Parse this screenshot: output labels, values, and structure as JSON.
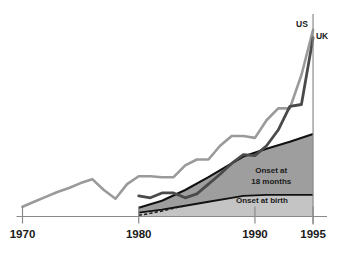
{
  "chart_data": {
    "type": "line",
    "title": "",
    "xlabel": "",
    "ylabel": "",
    "xlim": [
      1970,
      1996.2
    ],
    "ylim": [
      0,
      100
    ],
    "grid": false,
    "legend_position": "inline-endpoint-labels",
    "tick_labels": [
      "1970",
      "1980",
      "1990",
      "1995"
    ],
    "ticks": [
      1970,
      1980,
      1990,
      1995
    ],
    "annotations": [
      {
        "text": "Onset at 18 months",
        "line1": "Onset at",
        "line2": "18 months",
        "x": 1991.4,
        "y": 19
      },
      {
        "text": "Onset at birth",
        "line1": "Onset at birth",
        "x": 1990.6,
        "y": 7
      }
    ],
    "series": [
      {
        "name": "US",
        "label": "US",
        "color": "#9a9a9a",
        "style": "solid",
        "x": [
          1970,
          1971,
          1972,
          1973,
          1974,
          1975,
          1976,
          1977,
          1978,
          1979,
          1980,
          1981,
          1982,
          1983,
          1984,
          1985,
          1986,
          1987,
          1988,
          1989,
          1990,
          1991,
          1992,
          1993,
          1994,
          1995
        ],
        "values": [
          5.0,
          7.5,
          10.0,
          12.5,
          14.5,
          17.0,
          19.0,
          13.5,
          9.0,
          16.5,
          20.5,
          20.5,
          20.0,
          20.0,
          26.0,
          29.0,
          29.0,
          36.0,
          41.0,
          41.0,
          40.0,
          49.0,
          55.0,
          55.0,
          72.0,
          95.0
        ]
      },
      {
        "name": "UK",
        "label": "UK",
        "color": "#4a4a4a",
        "style": "solid",
        "x": [
          1980,
          1981,
          1982,
          1983,
          1984,
          1985,
          1986,
          1987,
          1988,
          1989,
          1990,
          1991,
          1992,
          1993,
          1994,
          1995
        ],
        "values": [
          10.5,
          9.5,
          12.0,
          12.0,
          9.5,
          11.5,
          16.5,
          21.5,
          27.0,
          31.5,
          31.0,
          36.0,
          44.0,
          56.0,
          57.0,
          91.0
        ]
      }
    ],
    "areas": [
      {
        "name": "Onset at birth",
        "color": "#c4c4c4",
        "x": [
          1980,
          1982,
          1984,
          1986,
          1988,
          1989,
          1991,
          1993,
          1995
        ],
        "values": [
          2.0,
          3.5,
          5.5,
          7.5,
          9.5,
          10.5,
          11.0,
          11.0,
          11.0
        ]
      },
      {
        "name": "Onset at 18 months",
        "color": "#9e9e9e",
        "x": [
          1980,
          1982,
          1984,
          1986,
          1988,
          1989,
          1991,
          1993,
          1995
        ],
        "values": [
          2.5,
          4.5,
          8.0,
          12.5,
          17.5,
          20.0,
          23.5,
          27.0,
          31.0
        ]
      }
    ],
    "dashed_segment": {
      "name": "projection",
      "color": "#1a1a1a",
      "style": "dashed",
      "x": [
        1980,
        1981,
        1982,
        1983,
        1983.8
      ],
      "values": [
        0.6,
        1.6,
        2.8,
        4.2,
        5.2
      ]
    },
    "axis_color": "#8a8a8a",
    "marker_line_year": 1995
  },
  "labels": {
    "us": "US",
    "uk": "UK",
    "onset_18_line1": "Onset at",
    "onset_18_line2": "18 months",
    "onset_birth": "Onset at birth",
    "tick_1970": "1970",
    "tick_1980": "1980",
    "tick_1990": "1990",
    "tick_1995": "1995"
  }
}
